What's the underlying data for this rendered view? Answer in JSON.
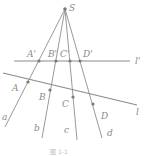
{
  "diagram": {
    "center": {
      "label": "S",
      "x": 65,
      "y": 9
    },
    "line_upper": {
      "label": "l'",
      "x1": 14,
      "y1": 61,
      "x2": 130,
      "y2": 61
    },
    "line_lower": {
      "label": "l",
      "x1": 3,
      "y1": 73,
      "x2": 137,
      "y2": 105
    },
    "upper_points": [
      {
        "label": "A'",
        "x": 39,
        "y": 61
      },
      {
        "label": "B'",
        "x": 56,
        "y": 61
      },
      {
        "label": "C'",
        "x": 70,
        "y": 61
      },
      {
        "label": "D'",
        "x": 80,
        "y": 61
      }
    ],
    "lower_points": [
      {
        "label": "A",
        "x": 28,
        "y": 82
      },
      {
        "label": "B",
        "x": 50,
        "y": 90
      },
      {
        "label": "C",
        "x": 73,
        "y": 97
      },
      {
        "label": "D",
        "x": 93,
        "y": 104
      }
    ],
    "rays": [
      {
        "label": "a",
        "x2": 5,
        "y2": 127
      },
      {
        "label": "b",
        "x2": 42,
        "y2": 138
      },
      {
        "label": "c",
        "x2": 77,
        "y2": 140
      },
      {
        "label": "d",
        "x2": 102,
        "y2": 138
      }
    ],
    "labels": {
      "S": "S",
      "l_prime": "l'",
      "l": "l",
      "A_prime": "A'",
      "B_prime": "B'",
      "C_prime": "C'",
      "D_prime": "D'",
      "A": "A",
      "B": "B",
      "C": "C",
      "D": "D",
      "a": "a",
      "b": "b",
      "c": "c",
      "d": "d"
    },
    "caption": "图 1-1"
  },
  "colors": {
    "line": "#9a9a9a",
    "point": "#7a7a7a",
    "label": "#8a8a8a"
  }
}
